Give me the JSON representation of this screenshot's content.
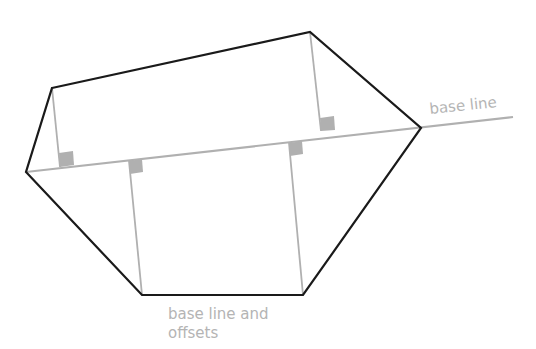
{
  "diagram": {
    "labels": {
      "base_line": "base line",
      "base_line_offsets_1": "base line and",
      "base_line_offsets_2": "offsets"
    },
    "colors": {
      "outline": "#1a1a1a",
      "construction": "#b0b0b0",
      "right_angle_marker": "#b0b0b0",
      "label": "#b4b4b4"
    }
  }
}
